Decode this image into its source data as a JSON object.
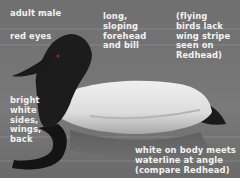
{
  "image": {
    "subject": "canvasback duck",
    "annotations": [
      {
        "id": "adult-male",
        "text": "adult male",
        "x": 10,
        "y": 9
      },
      {
        "id": "red-eyes",
        "text": "red eyes",
        "x": 10,
        "y": 32
      },
      {
        "id": "forehead",
        "text": "long,\nsloping\nforehead\nand bill",
        "x": 103,
        "y": 12
      },
      {
        "id": "wing-stripe",
        "text": "(flying\nbirds lack\nwing stripe\nseen on\nRedhead)",
        "x": 176,
        "y": 12
      },
      {
        "id": "bright-white",
        "text": "bright\nwhite\nsides,\nwings,\nback",
        "x": 10,
        "y": 96
      },
      {
        "id": "waterline",
        "text": "white on body meets\nwaterline at angle\n(compare Redhead)",
        "x": 135,
        "y": 146
      }
    ],
    "colors": {
      "background": "#737373",
      "label": "#f2f2f2",
      "head": "#1c1c1c",
      "body_white": "#e6e6e6",
      "body_shadow": "#9a9a9a"
    }
  }
}
